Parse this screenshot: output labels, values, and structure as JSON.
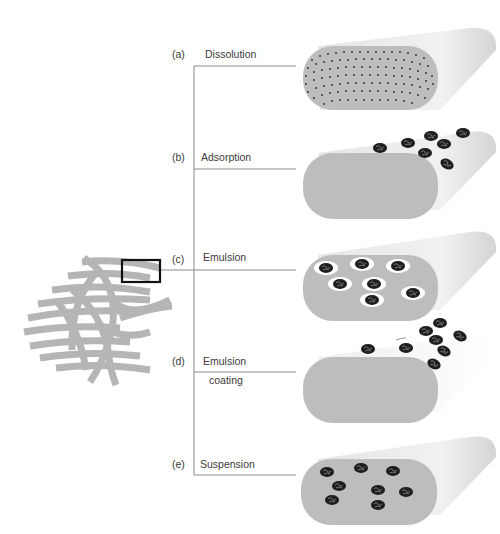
{
  "diagram": {
    "methods": [
      {
        "letter": "(a)",
        "name": "Dissolution",
        "name2": ""
      },
      {
        "letter": "(b)",
        "name": "Adsorption",
        "name2": ""
      },
      {
        "letter": "(c)",
        "name": "Emulsion",
        "name2": ""
      },
      {
        "letter": "(d)",
        "name": "Emulsion",
        "name2": "coating"
      },
      {
        "letter": "(e)",
        "name": "Suspension",
        "name2": ""
      }
    ],
    "colors": {
      "fiber": "#b9b9b9",
      "fiber_face": "#bdbdbd",
      "line": "#8a8a8a",
      "particle": "#1e1e1e",
      "droplet": "#ffffff",
      "box": "#111111"
    }
  }
}
